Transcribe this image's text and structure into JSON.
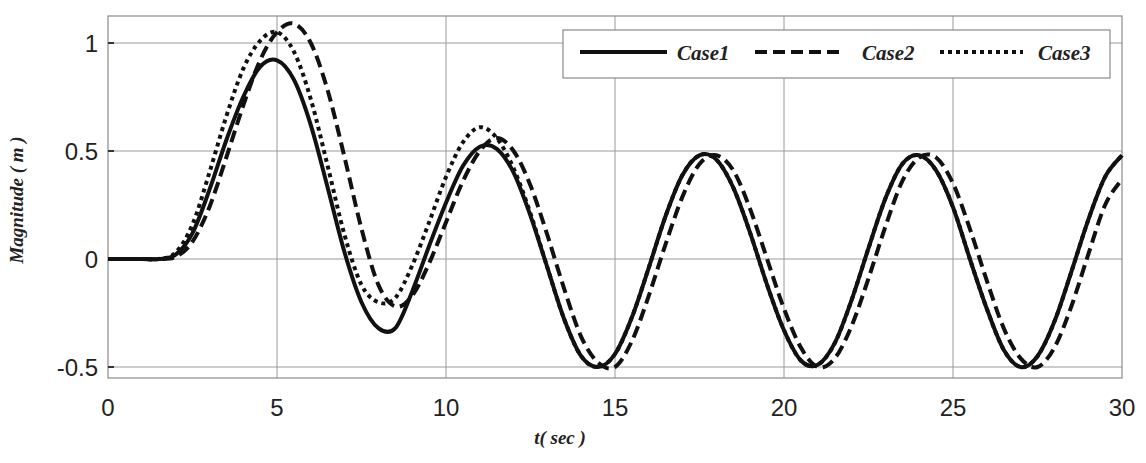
{
  "chart_data": {
    "type": "line",
    "title": "",
    "xlabel": "t( sec )",
    "ylabel": "Magnitude ( m )",
    "xlim": [
      0,
      30
    ],
    "ylim": [
      -0.55,
      1.1
    ],
    "xticks": [
      0,
      5,
      10,
      15,
      20,
      25,
      30
    ],
    "xtick_labels": [
      "0",
      "5",
      "10",
      "15",
      "20",
      "25",
      "30"
    ],
    "yticks": [
      -0.5,
      0,
      0.5,
      1
    ],
    "ytick_labels": [
      "-0.5",
      "0",
      "0.5",
      "1"
    ],
    "grid": true,
    "legend_position": "upper right",
    "x": [
      0,
      0.5,
      1,
      1.5,
      2,
      2.5,
      3,
      3.5,
      4,
      4.5,
      5,
      5.5,
      6,
      6.5,
      7,
      7.5,
      8,
      8.5,
      9,
      9.5,
      10,
      10.5,
      11,
      11.5,
      12,
      12.5,
      13,
      13.5,
      14,
      14.5,
      15,
      15.5,
      16,
      16.5,
      17,
      17.5,
      18,
      18.5,
      19,
      19.5,
      20,
      20.5,
      21,
      21.5,
      22,
      22.5,
      23,
      23.5,
      24,
      24.5,
      25,
      25.5,
      26,
      26.5,
      27,
      27.5,
      28,
      28.5,
      29,
      29.5,
      30
    ],
    "series": [
      {
        "name": "Case1",
        "style": "solid",
        "values": [
          0,
          0,
          0,
          0,
          0.02,
          0.12,
          0.32,
          0.55,
          0.75,
          0.89,
          0.92,
          0.83,
          0.62,
          0.33,
          0.03,
          -0.2,
          -0.32,
          -0.32,
          -0.15,
          0.06,
          0.26,
          0.43,
          0.52,
          0.51,
          0.4,
          0.2,
          -0.04,
          -0.28,
          -0.45,
          -0.5,
          -0.44,
          -0.27,
          -0.04,
          0.2,
          0.39,
          0.48,
          0.46,
          0.33,
          0.12,
          -0.12,
          -0.33,
          -0.47,
          -0.49,
          -0.39,
          -0.19,
          0.05,
          0.28,
          0.44,
          0.48,
          0.41,
          0.24,
          0.0,
          -0.23,
          -0.42,
          -0.5,
          -0.45,
          -0.29,
          -0.06,
          0.18,
          0.38,
          0.48
        ]
      },
      {
        "name": "Case2",
        "style": "dashed",
        "values": [
          0,
          0,
          0,
          0,
          0.01,
          0.08,
          0.24,
          0.47,
          0.71,
          0.92,
          1.05,
          1.09,
          1.0,
          0.78,
          0.47,
          0.14,
          -0.12,
          -0.22,
          -0.17,
          -0.02,
          0.17,
          0.36,
          0.5,
          0.56,
          0.5,
          0.34,
          0.11,
          -0.14,
          -0.36,
          -0.48,
          -0.5,
          -0.38,
          -0.17,
          0.07,
          0.29,
          0.44,
          0.48,
          0.41,
          0.23,
          0.0,
          -0.23,
          -0.41,
          -0.5,
          -0.46,
          -0.31,
          -0.09,
          0.15,
          0.36,
          0.47,
          0.47,
          0.35,
          0.14,
          -0.1,
          -0.32,
          -0.46,
          -0.5,
          -0.41,
          -0.22,
          0.02,
          0.25,
          0.37
        ]
      },
      {
        "name": "Case3",
        "style": "dotted",
        "values": [
          0,
          0,
          0,
          0,
          0.03,
          0.16,
          0.4,
          0.66,
          0.88,
          1.01,
          1.05,
          0.96,
          0.74,
          0.43,
          0.11,
          -0.12,
          -0.2,
          -0.18,
          -0.03,
          0.17,
          0.38,
          0.54,
          0.61,
          0.56,
          0.42,
          0.21,
          -0.04,
          -0.28,
          -0.45,
          -0.5,
          -0.44,
          -0.27,
          -0.04,
          0.2,
          0.39,
          0.48,
          0.46,
          0.33,
          0.12,
          -0.12,
          -0.33,
          -0.47,
          -0.49,
          -0.39,
          -0.19,
          0.05,
          0.28,
          0.44,
          0.48,
          0.41,
          0.24,
          0.0,
          -0.23,
          -0.42,
          -0.5,
          -0.45,
          -0.29,
          -0.06,
          0.18,
          0.38,
          0.48
        ]
      }
    ]
  },
  "legend": {
    "items": [
      {
        "label": "Case1",
        "style": "solid"
      },
      {
        "label": "Case2",
        "style": "dashed"
      },
      {
        "label": "Case3",
        "style": "dotted"
      }
    ]
  },
  "axes": {
    "xlabel": "t( sec )",
    "ylabel": "Magnitude ( m )"
  },
  "colors": {
    "line": "#111111",
    "grid": "#9a9a9a",
    "background": "#ffffff"
  }
}
